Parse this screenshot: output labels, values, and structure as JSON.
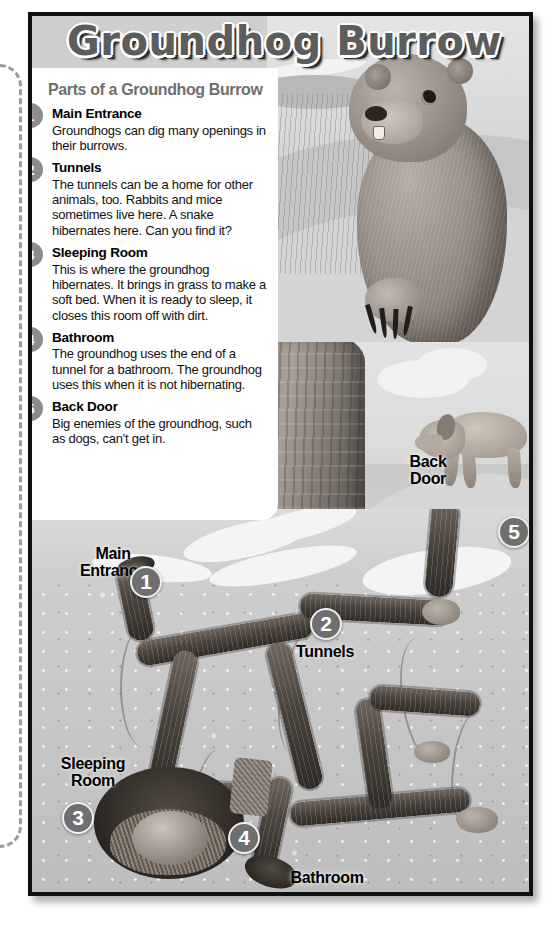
{
  "title": "Groundhog Burrow",
  "card": {
    "heading": "Parts of a Groundhog Burrow",
    "items": [
      {
        "number": "1",
        "term": "Main Entrance",
        "text": "Groundhogs can dig many openings in their burrows."
      },
      {
        "number": "2",
        "term": "Tunnels",
        "text": "The tunnels can be a home for other animals, too. Rabbits and mice sometimes live here. A snake hibernates here. Can you find it?"
      },
      {
        "number": "3",
        "term": "Sleeping Room",
        "text": "This is where the groundhog hibernates. It brings in grass to make a soft bed. When it is ready to sleep, it closes this room off with dirt."
      },
      {
        "number": "4",
        "term": "Bathroom",
        "text": "The groundhog uses the end of a tunnel for a bathroom. The groundhog uses this when it is not hibernating."
      },
      {
        "number": "5",
        "term": "Back Door",
        "text": "Big enemies of the groundhog, such as dogs, can't get in."
      }
    ]
  },
  "diagram": {
    "labels": [
      {
        "name": "main-entrance",
        "text": "Main\nEntrance",
        "marker": "1"
      },
      {
        "name": "tunnels",
        "text": "Tunnels",
        "marker": "2"
      },
      {
        "name": "sleeping-room",
        "text": "Sleeping\nRoom",
        "marker": "3"
      },
      {
        "name": "bathroom",
        "text": "Bathroom",
        "marker": "4"
      },
      {
        "name": "back-door",
        "text": "Back\nDoor",
        "marker": "5"
      }
    ]
  },
  "colors": {
    "title_fill": "#5d5d5d",
    "card_heading": "#6f6f6f",
    "badge": "#8c8c8c",
    "marker": "#6f6f6f",
    "frame_border": "#101010",
    "tunnel": "#3a342e",
    "soil": "#c9c9c9"
  }
}
